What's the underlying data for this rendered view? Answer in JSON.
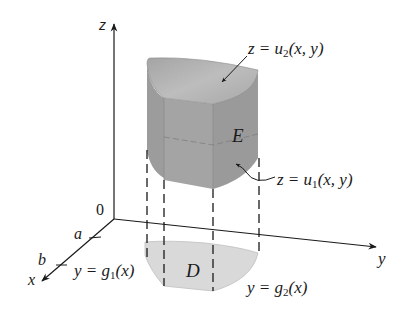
{
  "figure": {
    "type": "3d-solid-region-diagram",
    "axes": {
      "z_label": "z",
      "y_label": "y",
      "x_label": "x",
      "origin_label": "0",
      "x_ticks": [
        "a",
        "b"
      ]
    },
    "labels": {
      "upper_surface": {
        "prefix": "z = u",
        "sub": "2",
        "suffix": "(x, y)"
      },
      "lower_surface": {
        "prefix": "z = u",
        "sub": "1",
        "suffix": "(x, y)"
      },
      "solid": "E",
      "region": "D",
      "left_curve": {
        "prefix": "y = g",
        "sub": "1",
        "suffix": "(x)"
      },
      "right_curve": {
        "prefix": "y = g",
        "sub": "2",
        "suffix": "(x)"
      }
    },
    "colors": {
      "solid_top": "#b4b4b4",
      "solid_front": "#a2a2a2",
      "solid_side": "#9a9a9a",
      "region_fill": "#d9d9d9",
      "line": "#1a1a1a"
    }
  }
}
